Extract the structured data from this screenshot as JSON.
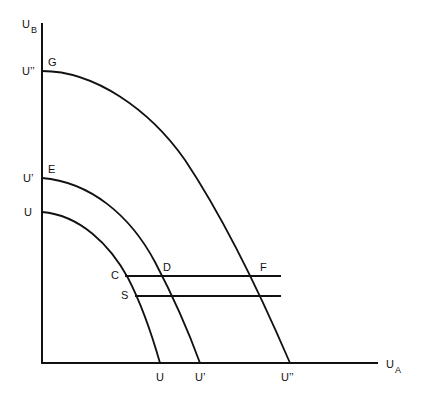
{
  "axes": {
    "y_label": "U",
    "y_label_sub": "B",
    "x_label": "U",
    "x_label_sub": "A"
  },
  "y_ticks": [
    {
      "label": "U''",
      "point": "G"
    },
    {
      "label": "U'",
      "point": "E"
    },
    {
      "label": "U",
      "point": ""
    }
  ],
  "x_ticks": [
    "U",
    "U'",
    "U''"
  ],
  "curves": [
    {
      "name": "UU",
      "y_intercept_label": "U",
      "x_intercept_label": "U"
    },
    {
      "name": "U'U'",
      "y_intercept_label": "U'",
      "x_intercept_label": "U'",
      "start_point": "E"
    },
    {
      "name": "U''U''",
      "y_intercept_label": "U''",
      "x_intercept_label": "U''",
      "start_point": "G"
    }
  ],
  "points": {
    "G": "G",
    "E": "E",
    "C": "C",
    "D": "D",
    "F": "F",
    "S": "S"
  },
  "labels": {
    "u_double_prime": "U’’",
    "u_prime": "U’",
    "u": "U"
  },
  "colors": {
    "line": "#111111",
    "background": "#ffffff"
  }
}
